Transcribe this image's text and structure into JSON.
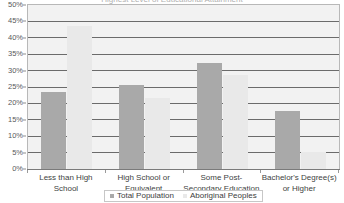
{
  "title_sliver": "Highest Level of Educational Attainment",
  "legend": {
    "position": "bottom",
    "entries": [
      {
        "label": "Total Population",
        "color": "#a9a9a9"
      },
      {
        "label": "Aboriginal Peoples",
        "color": "#e9e9e9"
      }
    ]
  },
  "axis": {
    "y_ticks": [
      "0%",
      "5%",
      "10%",
      "15%",
      "20%",
      "25%",
      "30%",
      "35%",
      "40%",
      "45%",
      "50%"
    ]
  },
  "chart_data": {
    "type": "bar",
    "title": "",
    "xlabel": "",
    "ylabel": "",
    "ylim": [
      0,
      50
    ],
    "ytick_step": 5,
    "ytick_format": "percent",
    "grid": true,
    "legend_position": "bottom",
    "categories": [
      "Less than High School",
      "High School or Equivalent",
      "Some Post-Secondary Education",
      "Bachelor's Degree(s) or Higher"
    ],
    "series": [
      {
        "name": "Total Population",
        "color": "#a9a9a9",
        "values": [
          23.4,
          25.5,
          32.2,
          17.8
        ]
      },
      {
        "name": "Aboriginal Peoples",
        "color": "#e9e9e9",
        "values": [
          43.5,
          21.5,
          28.6,
          5.2
        ]
      }
    ]
  }
}
